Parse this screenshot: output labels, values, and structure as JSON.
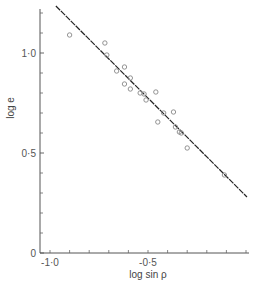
{
  "chart_data": {
    "type": "scatter",
    "title": "",
    "xlabel": "log sin ρ",
    "ylabel": "log e",
    "xlim": [
      -1.0,
      0.0
    ],
    "ylim": [
      0,
      1.22
    ],
    "grid": false,
    "legend": null,
    "x_ticks": [
      {
        "value": -1.0,
        "label": "-1·0"
      },
      {
        "value": -0.5,
        "label": "-0·5"
      }
    ],
    "x_minor_ticks": [
      -1.0,
      -0.9,
      -0.8,
      -0.7,
      -0.6,
      -0.5,
      -0.4,
      -0.3,
      -0.2,
      -0.1,
      0.0
    ],
    "y_ticks": [
      {
        "value": 0,
        "label": "0"
      },
      {
        "value": 0.5,
        "label": "0·5"
      },
      {
        "value": 1.0,
        "label": "1·0"
      }
    ],
    "y_minor_ticks": [
      0.1,
      0.2,
      0.3,
      0.4,
      0.6,
      0.7,
      0.8,
      0.9,
      1.1,
      1.2
    ],
    "series": [
      {
        "name": "observations",
        "marker": "open-circle",
        "points": [
          [
            -0.9,
            1.09
          ],
          [
            -0.72,
            1.05
          ],
          [
            -0.71,
            0.99
          ],
          [
            -0.66,
            0.91
          ],
          [
            -0.62,
            0.93
          ],
          [
            -0.59,
            0.875
          ],
          [
            -0.62,
            0.845
          ],
          [
            -0.59,
            0.82
          ],
          [
            -0.54,
            0.8
          ],
          [
            -0.52,
            0.795
          ],
          [
            -0.46,
            0.805
          ],
          [
            -0.51,
            0.765
          ],
          [
            -0.42,
            0.7
          ],
          [
            -0.37,
            0.705
          ],
          [
            -0.45,
            0.655
          ],
          [
            -0.36,
            0.63
          ],
          [
            -0.34,
            0.605
          ],
          [
            -0.33,
            0.6
          ],
          [
            -0.3,
            0.525
          ],
          [
            -0.11,
            0.39
          ]
        ]
      },
      {
        "name": "fit",
        "type": "line",
        "points": [
          [
            -0.97,
            1.235
          ],
          [
            0.005,
            0.28
          ]
        ]
      }
    ]
  },
  "labels": {
    "xlabel": "log sin ρ",
    "ylabel": "log e"
  }
}
